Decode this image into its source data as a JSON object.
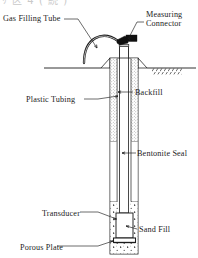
{
  "figure": {
    "type": "technical-cross-section",
    "caption_strip": "ﾘ 区 4 ( 続 )",
    "background_color": "#ffffff",
    "line_color": "#1c1c1c",
    "connector_color": "#101010",
    "stipple_color": "#8c8c8c"
  },
  "labels": {
    "gas_filling_tube": "Gas Filling Tube",
    "measuring_connector_line1": "Measuring",
    "measuring_connector_line2": "Connector",
    "plastic_tubing": "Plastic Tubing",
    "backfill": "Backfill",
    "bentonite_seal": "Bentonite Seal",
    "transducer": "Transducer",
    "sand_fill": "Sand Fill",
    "porous_plate": "Porous Plate"
  },
  "components": [
    {
      "name": "gas-filling-tube",
      "label": "Gas Filling Tube",
      "region": "curved arc tube above wellhead"
    },
    {
      "name": "measuring-connector",
      "label": "Measuring Connector",
      "region": "black block at tube top"
    },
    {
      "name": "ground-surface",
      "label": "",
      "region": "horizontal grade line with hatching"
    },
    {
      "name": "backfill",
      "label": "Backfill",
      "region": "stippled annulus, upper borehole"
    },
    {
      "name": "plastic-tubing",
      "label": "Plastic Tubing",
      "region": "inner vertical tube"
    },
    {
      "name": "bentonite-seal",
      "label": "Bentonite Seal",
      "region": "blank annulus, mid borehole"
    },
    {
      "name": "sand-fill",
      "label": "Sand Fill",
      "region": "dotted zone, bottom of borehole"
    },
    {
      "name": "transducer",
      "label": "Transducer",
      "region": "rectangular body at tube base"
    },
    {
      "name": "porous-plate",
      "label": "Porous Plate",
      "region": "plate beneath transducer"
    }
  ]
}
